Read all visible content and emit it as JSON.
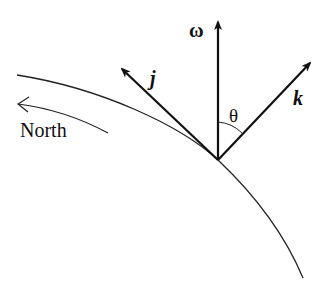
{
  "diagram": {
    "title": "",
    "labels": {
      "omega": "ω",
      "j": "j",
      "k": "k",
      "theta": "θ",
      "north": "North"
    },
    "vectors": [
      {
        "name": "omega",
        "description": "angular velocity of Earth, pointing vertically up"
      },
      {
        "name": "j",
        "description": "unit vector tangent to surface pointing north"
      },
      {
        "name": "k",
        "description": "unit vector normal to surface (local vertical)"
      }
    ],
    "angle": {
      "name": "theta",
      "between": [
        "omega",
        "k"
      ]
    },
    "surface": "Earth surface (curved arc)",
    "direction_indicator": "North",
    "colors": {
      "ink": "#111111",
      "background": "#ffffff"
    }
  }
}
